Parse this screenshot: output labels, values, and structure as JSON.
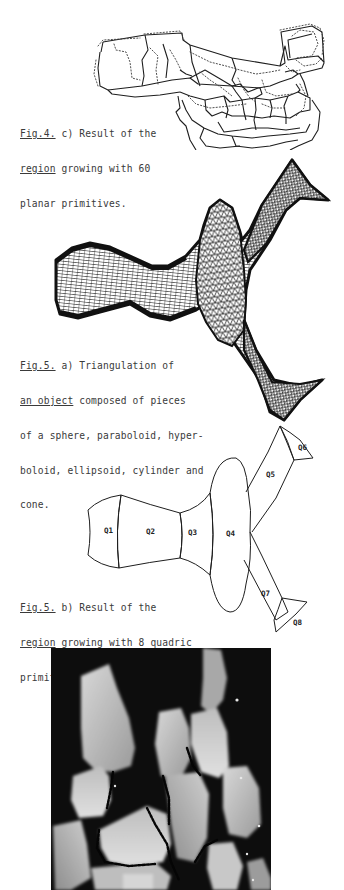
{
  "figures": [
    {
      "id": "fig4c",
      "caption": {
        "ref": "Fig.4.",
        "line1_rest": " c) Result of the",
        "line2_ref": "region",
        "line2_rest": " growing with 60",
        "line3": "planar primitives."
      }
    },
    {
      "id": "fig5a",
      "caption": {
        "ref": "Fig.5.",
        "line1_rest": " a) Triangulation of",
        "line2_ref": "an object",
        "line2_rest": " composed of pieces",
        "line3": "of a sphere, paraboloid, hyper-",
        "line4": "boloid, ellipsoid, cylinder and",
        "line5": "cone."
      }
    },
    {
      "id": "fig5b",
      "caption": {
        "ref": "Fig.5.",
        "line1_rest": " b) Result of the",
        "line2_ref": "region",
        "line2_rest": " growing with 8 quadric",
        "line3": "primitives."
      },
      "region_labels": [
        "Q1",
        "Q2",
        "Q3",
        "Q4",
        "Q5",
        "Q6",
        "Q7",
        "Q8"
      ]
    },
    {
      "id": "range-image",
      "description": "grayscale range image photograph"
    }
  ],
  "colors": {
    "ink": "#222222",
    "caption_ink": "#3a3a3a",
    "photo_bg": "#0d0d0d",
    "paper": "#ffffff"
  }
}
